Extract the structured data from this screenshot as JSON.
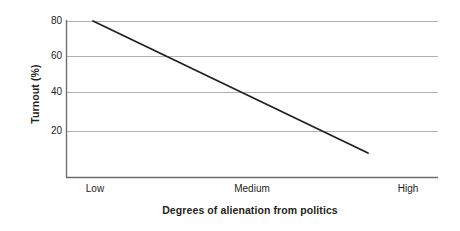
{
  "chart_data": {
    "type": "line",
    "title": "",
    "xlabel": "Degrees of alienation from politics",
    "ylabel": "Turnout (%)",
    "x_categories": [
      "Low",
      "Medium",
      "High"
    ],
    "y_ticks": [
      80,
      60,
      40,
      20
    ],
    "ylim": [
      0,
      80
    ],
    "grid": "horizontal",
    "legend": "none",
    "series": [
      {
        "name": "Turnout",
        "points": [
          {
            "x": "Low",
            "y": 80
          },
          {
            "x": "Medium",
            "y": 41
          },
          {
            "x": "High",
            "y": 8
          }
        ],
        "color": "#231f20"
      }
    ]
  },
  "axes": {
    "y_title": "Turnout (%)",
    "x_title": "Degrees of alienation from politics",
    "y_tick_labels": [
      "80",
      "60",
      "40",
      "20"
    ],
    "x_tick_labels": [
      "Low",
      "Medium",
      "High"
    ]
  },
  "colors": {
    "line": "#231f20",
    "grid": "#b3b3b3",
    "axis": "#6d6e71",
    "background": "#ffffff",
    "text": "#231f20"
  }
}
